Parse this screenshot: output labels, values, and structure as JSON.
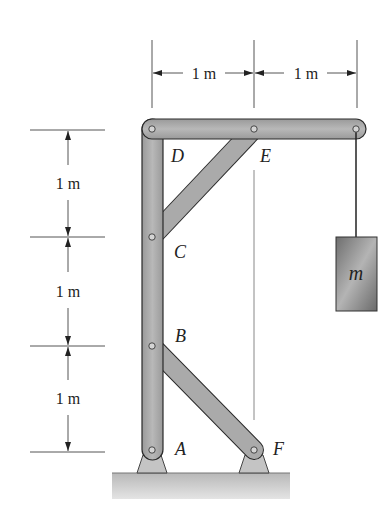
{
  "diagram": {
    "type": "frame-structure",
    "dimensions": {
      "horizontal": [
        "1 m",
        "1 m"
      ],
      "vertical": [
        "1 m",
        "1 m",
        "1 m"
      ]
    },
    "points": {
      "A": "A",
      "B": "B",
      "C": "C",
      "D": "D",
      "E": "E",
      "F": "F"
    },
    "mass_label": "m",
    "colors": {
      "member_fill": "#a8a8a8",
      "member_stroke": "#2a2a2a",
      "ground_fill": "#c8c8c8",
      "mass_fill": "#8c8c8c",
      "dim_line": "#555555"
    }
  }
}
